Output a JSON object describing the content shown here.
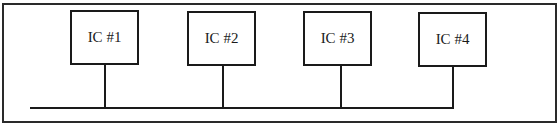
{
  "diagram": {
    "type": "bus-topology",
    "nodes": [
      {
        "id": "ic1",
        "label": "IC #1"
      },
      {
        "id": "ic2",
        "label": "IC #2"
      },
      {
        "id": "ic3",
        "label": "IC #3"
      },
      {
        "id": "ic4",
        "label": "IC #4"
      }
    ],
    "edges": [
      {
        "from": "ic1",
        "to": "bus"
      },
      {
        "from": "ic2",
        "to": "bus"
      },
      {
        "from": "ic3",
        "to": "bus"
      },
      {
        "from": "ic4",
        "to": "bus"
      }
    ],
    "colors": {
      "stroke": "#1a1a1a",
      "background": "#ffffff"
    }
  }
}
